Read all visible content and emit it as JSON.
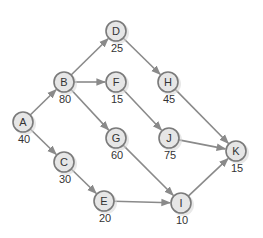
{
  "diagram": {
    "type": "directed-network",
    "colors": {
      "edge": "#8a8a8a",
      "node_fill": "#e6e6e6",
      "node_stroke": "#7a7a7a",
      "text": "#333333"
    },
    "nodes": [
      {
        "id": "A",
        "label": "A",
        "value": "40",
        "x": 23,
        "y": 122
      },
      {
        "id": "B",
        "label": "B",
        "value": "80",
        "x": 64,
        "y": 82
      },
      {
        "id": "C",
        "label": "C",
        "value": "30",
        "x": 64,
        "y": 162
      },
      {
        "id": "D",
        "label": "D",
        "value": "25",
        "x": 116,
        "y": 31
      },
      {
        "id": "E",
        "label": "E",
        "value": "20",
        "x": 104,
        "y": 201
      },
      {
        "id": "F",
        "label": "F",
        "value": "15",
        "x": 116,
        "y": 82
      },
      {
        "id": "G",
        "label": "G",
        "value": "60",
        "x": 116,
        "y": 138
      },
      {
        "id": "H",
        "label": "H",
        "value": "45",
        "x": 168,
        "y": 82
      },
      {
        "id": "I",
        "label": "I",
        "value": "10",
        "x": 181,
        "y": 203
      },
      {
        "id": "J",
        "label": "J",
        "value": "75",
        "x": 169,
        "y": 138
      },
      {
        "id": "K",
        "label": "K",
        "value": "15",
        "x": 236,
        "y": 151
      }
    ],
    "edges": [
      {
        "from": "A",
        "to": "B"
      },
      {
        "from": "A",
        "to": "C"
      },
      {
        "from": "B",
        "to": "D"
      },
      {
        "from": "B",
        "to": "F"
      },
      {
        "from": "B",
        "to": "G"
      },
      {
        "from": "C",
        "to": "E"
      },
      {
        "from": "D",
        "to": "H"
      },
      {
        "from": "F",
        "to": "J"
      },
      {
        "from": "G",
        "to": "I"
      },
      {
        "from": "E",
        "to": "I"
      },
      {
        "from": "H",
        "to": "K"
      },
      {
        "from": "J",
        "to": "K"
      },
      {
        "from": "I",
        "to": "K"
      }
    ]
  }
}
